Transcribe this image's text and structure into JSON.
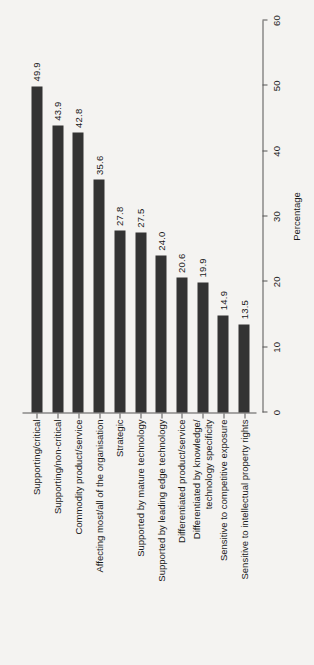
{
  "chart_data": {
    "type": "bar",
    "title": "",
    "subtitle": "",
    "orientation": "vertical-rotated",
    "xlabel": "",
    "ylabel": "Percentage",
    "ylim": [
      0,
      60
    ],
    "yticks": [
      0,
      10,
      20,
      30,
      40,
      50,
      60
    ],
    "ytick_labels": [
      "0",
      "10",
      "20",
      "30",
      "40",
      "50",
      "60"
    ],
    "grid": false,
    "legend": null,
    "bar_color": "#333333",
    "background_color": "#f4f3f1",
    "categories": [
      "Supporting/critical",
      "Supporting/non-critical",
      "Commodity product/service",
      "Affecting most/all of the organisation",
      "Strategic",
      "Supported by mature technology",
      "Supported by leading edge technology",
      "Differentiated product/service",
      "Differentiated by knowledge/\ntechnology specificity",
      "Sensitive to competitive exposure",
      "Sensitive to intellectual property rights"
    ],
    "values": [
      49.9,
      43.9,
      42.8,
      35.6,
      27.8,
      27.5,
      24.0,
      20.6,
      19.9,
      14.9,
      13.5
    ],
    "value_labels": [
      "49.9",
      "43.9",
      "42.8",
      "35.6",
      "27.8",
      "27.5",
      "24.0",
      "20.6",
      "19.9",
      "14.9",
      "13.5"
    ]
  }
}
